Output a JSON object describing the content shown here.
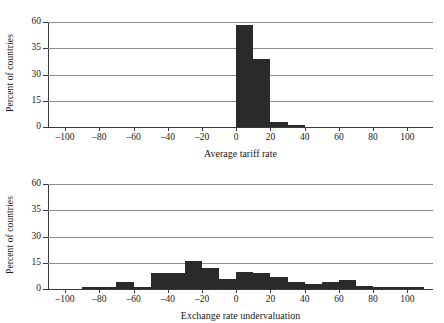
{
  "figure": {
    "ylabel": "Percent of countries",
    "bar_color": "#2a2a2a",
    "grid_color": "#8e8e8e",
    "axis_color": "#3a3a3a"
  },
  "chart_data": [
    {
      "type": "bar",
      "title": "",
      "xlabel": "Average tariff rate",
      "ylabel": "Percent of countries",
      "xlim": [
        -110,
        115
      ],
      "ylim": [
        0,
        60
      ],
      "grid": true,
      "legend": "none",
      "xticks": [
        -100,
        -80,
        -60,
        -40,
        -20,
        0,
        20,
        40,
        60,
        80,
        100
      ],
      "xticklabels": [
        "–100",
        "–80",
        "–60",
        "–40",
        "–20",
        "0",
        "20",
        "40",
        "60",
        "80",
        "100"
      ],
      "yticks": [
        0,
        15,
        30,
        35,
        60
      ],
      "yticklabels": [
        "0",
        "15",
        "30",
        "35",
        "60"
      ],
      "bin_edges": [
        0,
        10,
        20,
        30,
        40
      ],
      "values": [
        57,
        33,
        3,
        1
      ],
      "bins": [
        {
          "x0": 0,
          "x1": 10,
          "value": 57
        },
        {
          "x0": 10,
          "x1": 20,
          "value": 33
        },
        {
          "x0": 20,
          "x1": 30,
          "value": 3
        },
        {
          "x0": 30,
          "x1": 40,
          "value": 1
        }
      ]
    },
    {
      "type": "bar",
      "title": "",
      "xlabel": "Exchange rate undervaluation",
      "ylabel": "Percent of countries",
      "xlim": [
        -110,
        115
      ],
      "ylim": [
        0,
        60
      ],
      "grid": true,
      "legend": "none",
      "xticks": [
        -100,
        -80,
        -60,
        -40,
        -20,
        0,
        20,
        40,
        60,
        80,
        100
      ],
      "xticklabels": [
        "–100",
        "–80",
        "–60",
        "–40",
        "–20",
        "0",
        "20",
        "40",
        "60",
        "80",
        "100"
      ],
      "yticks": [
        0,
        15,
        30,
        35,
        60
      ],
      "yticklabels": [
        "0",
        "15",
        "30",
        "35",
        "60"
      ],
      "bin_edges": [
        -90,
        -80,
        -70,
        -60,
        -50,
        -40,
        -30,
        -20,
        -10,
        0,
        10,
        20,
        30,
        40,
        50,
        60,
        70,
        80,
        90,
        100,
        110
      ],
      "values": [
        1,
        1,
        4,
        1,
        9,
        9,
        16,
        12,
        6,
        10,
        9,
        7,
        4,
        3,
        4,
        5,
        2,
        1,
        1,
        1
      ],
      "bins": [
        {
          "x0": -90,
          "x1": -80,
          "value": 1
        },
        {
          "x0": -80,
          "x1": -70,
          "value": 1
        },
        {
          "x0": -70,
          "x1": -60,
          "value": 4
        },
        {
          "x0": -60,
          "x1": -50,
          "value": 1
        },
        {
          "x0": -50,
          "x1": -40,
          "value": 9
        },
        {
          "x0": -40,
          "x1": -30,
          "value": 9
        },
        {
          "x0": -30,
          "x1": -20,
          "value": 16
        },
        {
          "x0": -20,
          "x1": -10,
          "value": 12
        },
        {
          "x0": -10,
          "x1": 0,
          "value": 6
        },
        {
          "x0": 0,
          "x1": 10,
          "value": 10
        },
        {
          "x0": 10,
          "x1": 20,
          "value": 9
        },
        {
          "x0": 20,
          "x1": 30,
          "value": 7
        },
        {
          "x0": 30,
          "x1": 40,
          "value": 4
        },
        {
          "x0": 40,
          "x1": 50,
          "value": 3
        },
        {
          "x0": 50,
          "x1": 60,
          "value": 4
        },
        {
          "x0": 60,
          "x1": 70,
          "value": 5
        },
        {
          "x0": 70,
          "x1": 80,
          "value": 2
        },
        {
          "x0": 80,
          "x1": 90,
          "value": 1
        },
        {
          "x0": 90,
          "x1": 100,
          "value": 1
        },
        {
          "x0": 100,
          "x1": 110,
          "value": 1
        }
      ]
    }
  ]
}
